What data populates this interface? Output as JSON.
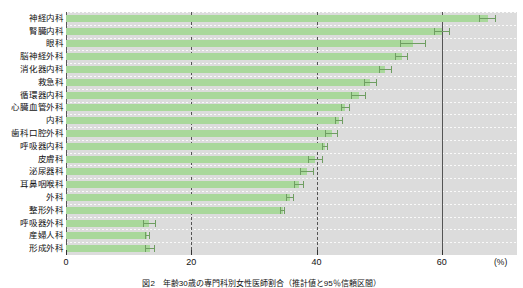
{
  "chart_data": {
    "type": "bar",
    "orientation": "horizontal",
    "title": "",
    "xlabel": "(%)",
    "ylabel": "",
    "xlim": [
      0,
      72
    ],
    "xticks": [
      0,
      20,
      40,
      60
    ],
    "xtick_labels": [
      "0",
      "20",
      "40",
      "60"
    ],
    "unit": "(%)",
    "grid": "vertical dashed gridlines at 20 and 40, solid line at 0 and 60",
    "legend": "none",
    "error_bars": "95% confidence interval whiskers at the end of each bar",
    "categories": [
      "神経内科",
      "腎臓内科",
      "眼科",
      "脳神経外科",
      "消化器内科",
      "救急科",
      "循環器内科",
      "心臓血管外科",
      "内科",
      "歯科口腔外科",
      "呼吸器内科",
      "皮膚科",
      "泌尿器科",
      "耳鼻咽喉科",
      "外科",
      "整形外科",
      "呼吸器外科",
      "産婦人科",
      "形成外科"
    ],
    "values": [
      67.3,
      60.0,
      55.4,
      53.6,
      51.0,
      48.6,
      46.7,
      44.6,
      43.6,
      42.4,
      41.3,
      39.8,
      38.5,
      37.2,
      35.8,
      34.6,
      13.3,
      13.0,
      13.4
    ],
    "error_low": [
      66.0,
      58.7,
      53.4,
      52.6,
      49.9,
      47.5,
      45.5,
      43.9,
      42.9,
      41.3,
      40.8,
      38.6,
      37.4,
      36.4,
      35.2,
      34.2,
      12.3,
      12.6,
      12.6
    ],
    "error_high": [
      68.6,
      61.3,
      57.4,
      54.6,
      52.1,
      49.7,
      47.9,
      45.3,
      44.3,
      43.5,
      41.8,
      41.0,
      39.6,
      38.0,
      36.4,
      35.0,
      14.3,
      13.4,
      14.2
    ],
    "colors": {
      "bar": "#a9d89b",
      "plot_background": "#dcdcdc",
      "error_bar": "#6f9e62",
      "gridline": "#4a4a4a"
    }
  },
  "caption": "図2　年齢30歳の専門科別女性医師割合（推計値と95％信頼区間）",
  "axis": {
    "x_unit_label": "(%)"
  }
}
